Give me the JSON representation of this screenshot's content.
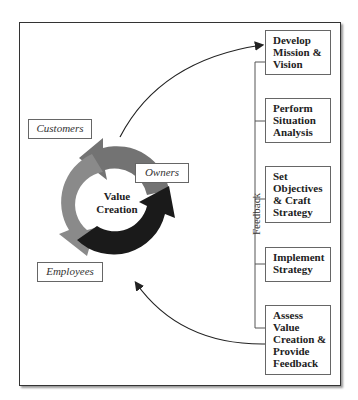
{
  "diagram": {
    "cycle": {
      "center_label_line1": "Value",
      "center_label_line2": "Creation",
      "stakeholders": [
        {
          "label": "Customers",
          "color": "#777777"
        },
        {
          "label": "Owners",
          "color": "#1a1a1a"
        },
        {
          "label": "Employees",
          "color": "#888888"
        }
      ]
    },
    "steps": [
      {
        "lines": [
          "Develop",
          "Mission &",
          "Vision"
        ]
      },
      {
        "lines": [
          "Perform",
          "Situation",
          "Analysis"
        ]
      },
      {
        "lines": [
          "Set",
          "Objectives",
          "& Craft",
          "Strategy"
        ]
      },
      {
        "lines": [
          "Implement",
          "Strategy"
        ]
      },
      {
        "lines": [
          "Assess",
          "Value",
          "Creation &",
          "Provide",
          "Feedback"
        ]
      }
    ],
    "feedback_label": "Feedback"
  }
}
